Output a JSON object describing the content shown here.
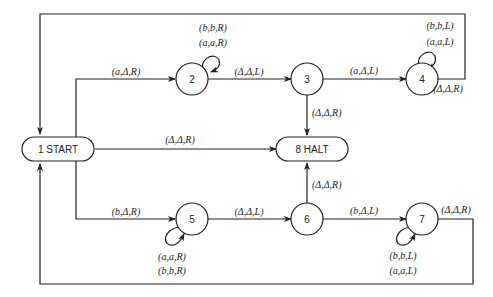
{
  "diagram": {
    "type": "turing-machine-state-diagram",
    "states": [
      {
        "id": "1",
        "label": "1 START",
        "shape": "rounded-rect"
      },
      {
        "id": "2",
        "label": "2",
        "shape": "circle"
      },
      {
        "id": "3",
        "label": "3",
        "shape": "circle"
      },
      {
        "id": "4",
        "label": "4",
        "shape": "circle"
      },
      {
        "id": "5",
        "label": "5",
        "shape": "circle"
      },
      {
        "id": "6",
        "label": "6",
        "shape": "circle"
      },
      {
        "id": "7",
        "label": "7",
        "shape": "circle"
      },
      {
        "id": "8",
        "label": "8 HALT",
        "shape": "rounded-rect"
      }
    ],
    "edges": {
      "e1_2": "(a,Δ,R)",
      "e2_self_top": "(b,b,R)",
      "e2_self_bottom": "(a,a,R)",
      "e2_3": "(Δ,Δ,L)",
      "e3_4": "(a,Δ,L)",
      "e3_8": "(Δ,Δ,R)",
      "e4_self_top": "(b,b,L)",
      "e4_self_bottom": "(a,a,L)",
      "e4_1": "(Δ,Δ,R)",
      "e1_8": "(Δ,Δ,R)",
      "e1_5": "(b,Δ,R)",
      "e5_self_top": "(a,a,R)",
      "e5_self_bottom": "(b,b,R)",
      "e5_6": "(Δ,Δ,L)",
      "e6_8": "(Δ,Δ,R)",
      "e6_7": "(b,Δ,L)",
      "e7_self_top": "(b,b,L)",
      "e7_self_bottom": "(a,a,L)",
      "e7_1": "(Δ,Δ,R)"
    }
  }
}
